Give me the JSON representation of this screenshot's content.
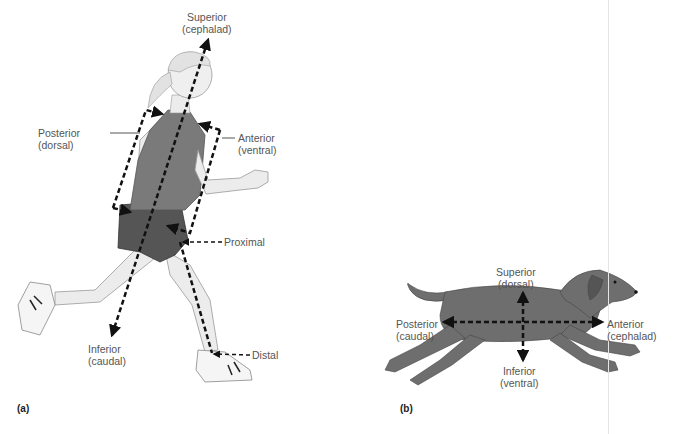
{
  "panel_a": {
    "tag": "(a)",
    "subject": "human runner",
    "labels": {
      "superior": [
        "Superior",
        "(cephalad)"
      ],
      "posterior": [
        "Posterior",
        "(dorsal)"
      ],
      "anterior": [
        "Anterior",
        "(ventral)"
      ],
      "proximal": [
        "Proximal"
      ],
      "inferior": [
        "Inferior",
        "(caudal)"
      ],
      "distal": [
        "Distal"
      ]
    }
  },
  "panel_b": {
    "tag": "(b)",
    "subject": "running dog",
    "labels": {
      "superior": [
        "Superior",
        "(dorsal)"
      ],
      "posterior": [
        "Posterior",
        "(caudal)"
      ],
      "anterior": [
        "Anterior",
        "(cephalad)"
      ],
      "inferior": [
        "Inferior",
        "(ventral)"
      ]
    }
  },
  "colors": {
    "arrow": "#111111",
    "label_text": "#555555",
    "shirt": "#7a7a7a",
    "shorts": "#555555",
    "skin": "#eeeeee",
    "dog": "#6e6e6e"
  }
}
